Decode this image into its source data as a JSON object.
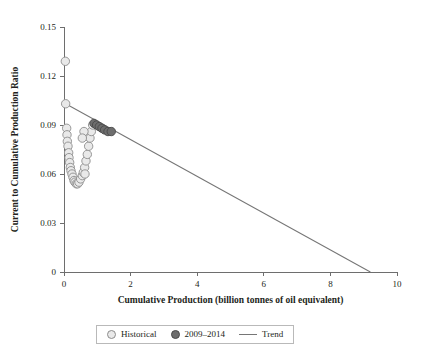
{
  "chart_data": {
    "type": "scatter",
    "title": "",
    "xlabel": "Cumulative Production (billion tonnes of oil equivalent)",
    "ylabel": "Current to Cumulative Production Ratio",
    "xlim": [
      0,
      10
    ],
    "ylim": [
      0,
      0.15
    ],
    "xticks": [
      0,
      2,
      4,
      6,
      8,
      10
    ],
    "xtick_labels": [
      "0",
      "2",
      "4",
      "6",
      "8",
      "10"
    ],
    "yticks": [
      0,
      0.03,
      0.06,
      0.09,
      0.12,
      0.15
    ],
    "ytick_labels": [
      "0",
      "0.03",
      "0.06",
      "0.09",
      "0.12",
      "0.15"
    ],
    "grid": false,
    "legend_position": "bottom-center",
    "series": [
      {
        "name": "Historical",
        "type": "scatter",
        "marker": "circle",
        "color": "#e9e9e9",
        "edge_color": "#8c8c8c",
        "points": [
          [
            0.04,
            0.129
          ],
          [
            0.05,
            0.103
          ],
          [
            0.08,
            0.088
          ],
          [
            0.09,
            0.084
          ],
          [
            0.1,
            0.08
          ],
          [
            0.12,
            0.077
          ],
          [
            0.14,
            0.073
          ],
          [
            0.15,
            0.07
          ],
          [
            0.17,
            0.067
          ],
          [
            0.19,
            0.064
          ],
          [
            0.21,
            0.062
          ],
          [
            0.24,
            0.06
          ],
          [
            0.27,
            0.058
          ],
          [
            0.3,
            0.056
          ],
          [
            0.33,
            0.055
          ],
          [
            0.37,
            0.054
          ],
          [
            0.41,
            0.054
          ],
          [
            0.45,
            0.055
          ],
          [
            0.5,
            0.057
          ],
          [
            0.55,
            0.059
          ],
          [
            0.58,
            0.061
          ],
          [
            0.62,
            0.064
          ],
          [
            0.63,
            0.06
          ],
          [
            0.66,
            0.068
          ],
          [
            0.7,
            0.072
          ],
          [
            0.74,
            0.077
          ],
          [
            0.78,
            0.082
          ],
          [
            0.82,
            0.086
          ],
          [
            0.86,
            0.09
          ],
          [
            0.6,
            0.086
          ],
          [
            0.55,
            0.082
          ]
        ]
      },
      {
        "name": "2009–2014",
        "type": "scatter",
        "marker": "circle",
        "color": "#6d6d6d",
        "edge_color": "#4a4a4a",
        "points": [
          [
            0.9,
            0.091
          ],
          [
            0.98,
            0.09
          ],
          [
            1.06,
            0.089
          ],
          [
            1.14,
            0.088
          ],
          [
            1.22,
            0.087
          ],
          [
            1.32,
            0.086
          ],
          [
            1.42,
            0.086
          ]
        ]
      },
      {
        "name": "Trend",
        "type": "line",
        "color": "#767676",
        "points": [
          [
            0.05,
            0.103
          ],
          [
            9.2,
            0.0
          ]
        ]
      }
    ]
  },
  "legend": {
    "items": [
      {
        "label": "Historical",
        "swatch": "hist-circle-marker"
      },
      {
        "label": "2009–2014",
        "swatch": "recent-circle-marker"
      },
      {
        "label": "Trend",
        "swatch": "trend-line-marker"
      }
    ]
  }
}
